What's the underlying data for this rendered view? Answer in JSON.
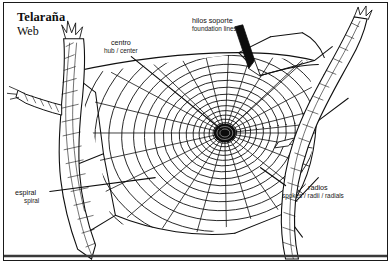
{
  "figure": {
    "title_es": "Telaraña",
    "title_en": "Web",
    "background_color": "#ffffff",
    "ink_color": "#111111",
    "border_color": "#1a1a1a"
  },
  "labels": {
    "center": {
      "es": "centro",
      "en": "hub / center",
      "target": "web-hub"
    },
    "foundation": {
      "es": "hilos soporte",
      "en": "foundation lines",
      "target": "web-foundation-lines"
    },
    "spiral": {
      "es": "espiral",
      "en": "spiral",
      "target": "web-spiral"
    },
    "radials": {
      "es": "radios",
      "en": "spokes / radii / radials",
      "target": "web-radials"
    }
  },
  "diagram": {
    "parts": [
      "branch-left",
      "branch-right",
      "web-foundation-lines",
      "web-radials",
      "web-spiral",
      "web-hub"
    ],
    "hub": {
      "x": 222,
      "y": 131
    },
    "spiral_turns": 17,
    "radial_count": 26
  }
}
